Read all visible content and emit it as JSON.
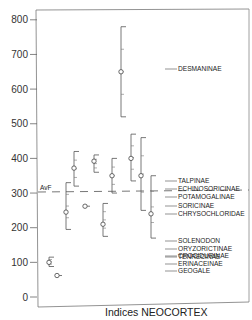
{
  "chart_data": {
    "type": "scatter",
    "title": "",
    "xlabel": "Indices NEOCORTEX",
    "ylabel": "",
    "ylim": [
      0,
      800
    ],
    "yticks": [
      0,
      100,
      200,
      300,
      400,
      500,
      600,
      700,
      800
    ],
    "grid": false,
    "legend_position": "right (labels with leader lines)",
    "reference_line": {
      "label": "AvF",
      "value": 305,
      "style": "dashed"
    },
    "series": [
      {
        "name": "TENRECINAE",
        "x": 14,
        "mean": 100,
        "min": 88,
        "max": 115
      },
      {
        "name": "GEOGALE",
        "x": 19,
        "mean": 62,
        "min": 62,
        "max": 62
      },
      {
        "name": "SOLENODON",
        "x": 25,
        "mean": 245,
        "min": 195,
        "max": 330
      },
      {
        "name": "ORYZORICTINAE",
        "x": 31,
        "mean": 372,
        "min": 320,
        "max": 420
      },
      {
        "name": "CROCIDURINAE",
        "x": 36,
        "mean": 262,
        "min": 262,
        "max": 262
      },
      {
        "name": "POTAMOGALINAE",
        "x": 41,
        "mean": 392,
        "min": 360,
        "max": 410
      },
      {
        "name": "ERINACEINAE",
        "x": 45,
        "mean": 210,
        "min": 175,
        "max": 270
      },
      {
        "name": "SORICINAE",
        "x": 49,
        "mean": 350,
        "min": 300,
        "max": 400
      },
      {
        "name": "DESMANINAE",
        "x": 55,
        "mean": 650,
        "min": 520,
        "max": 780
      },
      {
        "name": "ECHINOSORICINAE",
        "x": 60,
        "mean": 400,
        "min": 335,
        "max": 470
      },
      {
        "name": "TALPINAE",
        "x": 64,
        "mean": 350,
        "min": 250,
        "max": 460
      },
      {
        "name": "CHRYSOCHLORIDAE",
        "x": 70,
        "mean": 240,
        "min": 170,
        "max": 350
      }
    ]
  },
  "axis": {
    "y_tick_labels": [
      "0",
      "100",
      "200",
      "300",
      "400",
      "500",
      "600",
      "700",
      "800"
    ],
    "x_title": "Indices NEOCORTEX"
  },
  "reference": {
    "label": "AvF"
  },
  "labels": [
    {
      "text": "DESMANINAE",
      "y": 71
    },
    {
      "text": "TALPINAE",
      "y": 183
    },
    {
      "text": "ECHINOSORICINAE",
      "y": 191
    },
    {
      "text": "POTAMOGALINAE",
      "y": 199
    },
    {
      "text": "SORICINAE",
      "y": 208
    },
    {
      "text": "CHRYSOCHLORIDAE",
      "y": 216
    },
    {
      "text": "SOLENODON",
      "y": 243
    },
    {
      "text": "ORYZORICTINAE",
      "y": 251
    },
    {
      "text": "CROCIDURINAE",
      "y": 258
    },
    {
      "text": "ERINACEINAE",
      "y": 266
    },
    {
      "text": "TENRECINAE",
      "y": 259
    },
    {
      "text": "GEOGALE",
      "y": 273
    }
  ]
}
